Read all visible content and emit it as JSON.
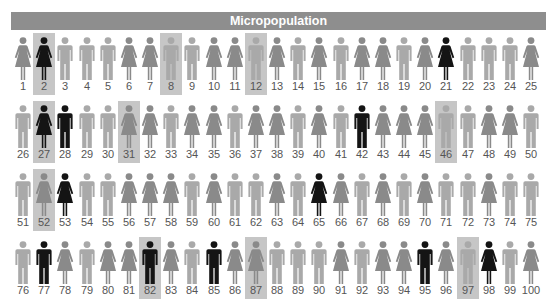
{
  "header": {
    "title": "Micropopulation"
  },
  "colors": {
    "male": "#a9a9a9",
    "female": "#8a8a8a",
    "selected": "#141414",
    "highlight_bg": "#c6c6c6",
    "header_bg": "#8e8e8e"
  },
  "legend_note": "Figures: M = male, F = female; black = selected; highlighted cells shaded",
  "people": [
    {
      "n": "1",
      "sex": "F",
      "black": false,
      "hl": false
    },
    {
      "n": "2",
      "sex": "F",
      "black": true,
      "hl": true
    },
    {
      "n": "3",
      "sex": "M",
      "black": false,
      "hl": false
    },
    {
      "n": "4",
      "sex": "M",
      "black": false,
      "hl": false
    },
    {
      "n": "5",
      "sex": "M",
      "black": false,
      "hl": false
    },
    {
      "n": "6",
      "sex": "F",
      "black": false,
      "hl": false
    },
    {
      "n": "7",
      "sex": "F",
      "black": false,
      "hl": false
    },
    {
      "n": "8",
      "sex": "M",
      "black": false,
      "hl": true
    },
    {
      "n": "9",
      "sex": "M",
      "black": false,
      "hl": false
    },
    {
      "n": "10",
      "sex": "F",
      "black": false,
      "hl": false
    },
    {
      "n": "11",
      "sex": "F",
      "black": false,
      "hl": false
    },
    {
      "n": "12",
      "sex": "M",
      "black": false,
      "hl": true
    },
    {
      "n": "13",
      "sex": "F",
      "black": false,
      "hl": false
    },
    {
      "n": "14",
      "sex": "M",
      "black": false,
      "hl": false
    },
    {
      "n": "15",
      "sex": "F",
      "black": false,
      "hl": false
    },
    {
      "n": "16",
      "sex": "M",
      "black": false,
      "hl": false
    },
    {
      "n": "17",
      "sex": "F",
      "black": false,
      "hl": false
    },
    {
      "n": "18",
      "sex": "F",
      "black": false,
      "hl": false
    },
    {
      "n": "19",
      "sex": "M",
      "black": false,
      "hl": false
    },
    {
      "n": "20",
      "sex": "F",
      "black": false,
      "hl": false
    },
    {
      "n": "21",
      "sex": "F",
      "black": true,
      "hl": false
    },
    {
      "n": "22",
      "sex": "M",
      "black": false,
      "hl": false
    },
    {
      "n": "23",
      "sex": "M",
      "black": false,
      "hl": false
    },
    {
      "n": "24",
      "sex": "M",
      "black": false,
      "hl": false
    },
    {
      "n": "25",
      "sex": "F",
      "black": false,
      "hl": false
    },
    {
      "n": "26",
      "sex": "M",
      "black": false,
      "hl": false
    },
    {
      "n": "27",
      "sex": "F",
      "black": true,
      "hl": true
    },
    {
      "n": "28",
      "sex": "M",
      "black": true,
      "hl": false
    },
    {
      "n": "29",
      "sex": "M",
      "black": false,
      "hl": false
    },
    {
      "n": "30",
      "sex": "M",
      "black": false,
      "hl": false
    },
    {
      "n": "31",
      "sex": "F",
      "black": false,
      "hl": true
    },
    {
      "n": "32",
      "sex": "F",
      "black": false,
      "hl": false
    },
    {
      "n": "33",
      "sex": "M",
      "black": false,
      "hl": false
    },
    {
      "n": "34",
      "sex": "F",
      "black": false,
      "hl": false
    },
    {
      "n": "35",
      "sex": "F",
      "black": false,
      "hl": false
    },
    {
      "n": "36",
      "sex": "M",
      "black": false,
      "hl": false
    },
    {
      "n": "37",
      "sex": "F",
      "black": false,
      "hl": false
    },
    {
      "n": "38",
      "sex": "F",
      "black": false,
      "hl": false
    },
    {
      "n": "39",
      "sex": "M",
      "black": false,
      "hl": false
    },
    {
      "n": "40",
      "sex": "F",
      "black": false,
      "hl": false
    },
    {
      "n": "41",
      "sex": "M",
      "black": false,
      "hl": false
    },
    {
      "n": "42",
      "sex": "M",
      "black": true,
      "hl": false
    },
    {
      "n": "43",
      "sex": "F",
      "black": false,
      "hl": false
    },
    {
      "n": "44",
      "sex": "F",
      "black": false,
      "hl": false
    },
    {
      "n": "45",
      "sex": "F",
      "black": false,
      "hl": false
    },
    {
      "n": "46",
      "sex": "M",
      "black": false,
      "hl": true
    },
    {
      "n": "47",
      "sex": "M",
      "black": false,
      "hl": false
    },
    {
      "n": "48",
      "sex": "F",
      "black": false,
      "hl": false
    },
    {
      "n": "49",
      "sex": "F",
      "black": false,
      "hl": false
    },
    {
      "n": "50",
      "sex": "M",
      "black": false,
      "hl": false
    },
    {
      "n": "51",
      "sex": "M",
      "black": false,
      "hl": false
    },
    {
      "n": "52",
      "sex": "F",
      "black": false,
      "hl": true
    },
    {
      "n": "53",
      "sex": "F",
      "black": true,
      "hl": false
    },
    {
      "n": "54",
      "sex": "M",
      "black": false,
      "hl": false
    },
    {
      "n": "55",
      "sex": "M",
      "black": false,
      "hl": false
    },
    {
      "n": "56",
      "sex": "F",
      "black": false,
      "hl": false
    },
    {
      "n": "57",
      "sex": "F",
      "black": false,
      "hl": false
    },
    {
      "n": "58",
      "sex": "F",
      "black": false,
      "hl": false
    },
    {
      "n": "59",
      "sex": "M",
      "black": false,
      "hl": false
    },
    {
      "n": "60",
      "sex": "F",
      "black": false,
      "hl": false
    },
    {
      "n": "61",
      "sex": "M",
      "black": false,
      "hl": false
    },
    {
      "n": "62",
      "sex": "M",
      "black": false,
      "hl": false
    },
    {
      "n": "63",
      "sex": "F",
      "black": false,
      "hl": false
    },
    {
      "n": "64",
      "sex": "M",
      "black": false,
      "hl": false
    },
    {
      "n": "65",
      "sex": "F",
      "black": true,
      "hl": false
    },
    {
      "n": "66",
      "sex": "F",
      "black": false,
      "hl": false
    },
    {
      "n": "67",
      "sex": "M",
      "black": false,
      "hl": false
    },
    {
      "n": "68",
      "sex": "F",
      "black": false,
      "hl": false
    },
    {
      "n": "69",
      "sex": "M",
      "black": false,
      "hl": false
    },
    {
      "n": "70",
      "sex": "F",
      "black": false,
      "hl": false
    },
    {
      "n": "71",
      "sex": "M",
      "black": false,
      "hl": false
    },
    {
      "n": "72",
      "sex": "M",
      "black": false,
      "hl": false
    },
    {
      "n": "73",
      "sex": "F",
      "black": false,
      "hl": false
    },
    {
      "n": "74",
      "sex": "M",
      "black": false,
      "hl": false
    },
    {
      "n": "75",
      "sex": "M",
      "black": false,
      "hl": false
    },
    {
      "n": "76",
      "sex": "M",
      "black": false,
      "hl": false
    },
    {
      "n": "77",
      "sex": "M",
      "black": true,
      "hl": false
    },
    {
      "n": "78",
      "sex": "F",
      "black": false,
      "hl": false
    },
    {
      "n": "79",
      "sex": "M",
      "black": false,
      "hl": false
    },
    {
      "n": "80",
      "sex": "F",
      "black": false,
      "hl": false
    },
    {
      "n": "81",
      "sex": "F",
      "black": false,
      "hl": false
    },
    {
      "n": "82",
      "sex": "M",
      "black": true,
      "hl": true
    },
    {
      "n": "83",
      "sex": "F",
      "black": false,
      "hl": false
    },
    {
      "n": "84",
      "sex": "M",
      "black": false,
      "hl": false
    },
    {
      "n": "85",
      "sex": "M",
      "black": true,
      "hl": false
    },
    {
      "n": "86",
      "sex": "F",
      "black": false,
      "hl": false
    },
    {
      "n": "87",
      "sex": "F",
      "black": false,
      "hl": true
    },
    {
      "n": "88",
      "sex": "M",
      "black": false,
      "hl": false
    },
    {
      "n": "89",
      "sex": "M",
      "black": false,
      "hl": false
    },
    {
      "n": "90",
      "sex": "M",
      "black": false,
      "hl": false
    },
    {
      "n": "91",
      "sex": "F",
      "black": false,
      "hl": false
    },
    {
      "n": "92",
      "sex": "M",
      "black": false,
      "hl": false
    },
    {
      "n": "93",
      "sex": "F",
      "black": false,
      "hl": false
    },
    {
      "n": "94",
      "sex": "F",
      "black": false,
      "hl": false
    },
    {
      "n": "95",
      "sex": "M",
      "black": true,
      "hl": false
    },
    {
      "n": "96",
      "sex": "F",
      "black": false,
      "hl": false
    },
    {
      "n": "97",
      "sex": "M",
      "black": false,
      "hl": true
    },
    {
      "n": "98",
      "sex": "F",
      "black": true,
      "hl": false
    },
    {
      "n": "99",
      "sex": "M",
      "black": false,
      "hl": false
    },
    {
      "n": "100",
      "sex": "F",
      "black": false,
      "hl": false
    }
  ]
}
